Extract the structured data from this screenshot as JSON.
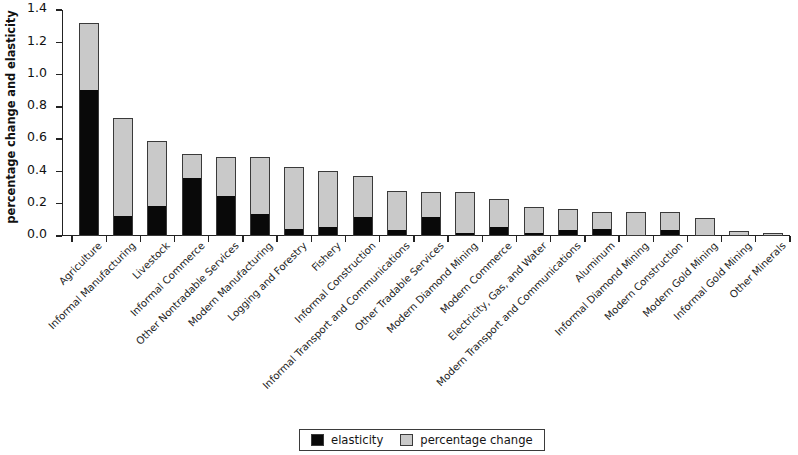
{
  "chart_data": {
    "type": "bar",
    "stacked": true,
    "title": "",
    "subtitle": "",
    "xlabel": "",
    "ylabel": "percentage change and elasticity",
    "ylim": [
      0.0,
      1.4
    ],
    "yticks": [
      "0.0",
      "0.2",
      "0.4",
      "0.6",
      "0.8",
      "1.0",
      "1.2",
      "1.4"
    ],
    "ytick_values": [
      0.0,
      0.2,
      0.4,
      0.6,
      0.8,
      1.0,
      1.2,
      1.4
    ],
    "grid": false,
    "legend_position": "bottom-center",
    "categories": [
      "Agriculture",
      "Informal Manufacturing",
      "Livestock",
      "Informal Commerce",
      "Other Nontradable Services",
      "Modern Manufacturing",
      "Logging and Forestry",
      "Fishery",
      "Informal Construction",
      "Informal Transport and Communications",
      "Other Tradable Services",
      "Modern Diamond Mining",
      "Modern Commerce",
      "Electricity, Gas, and Water",
      "Modern Transport and Communications",
      "Aluminum",
      "Informal Diamond Mining",
      "Modern Construction",
      "Modern Gold Mining",
      "Informal Gold Mining",
      "Other Minerals"
    ],
    "series": [
      {
        "name": "elasticity",
        "color": "#090909",
        "values": [
          0.9,
          0.12,
          0.18,
          0.35,
          0.24,
          0.13,
          0.04,
          0.05,
          0.11,
          0.03,
          0.11,
          0.01,
          0.05,
          0.01,
          0.03,
          0.04,
          0.0,
          0.03,
          0.0,
          0.0,
          0.0
        ]
      },
      {
        "name": "percentage change",
        "color": "#c9c9c9",
        "values": [
          0.42,
          0.61,
          0.41,
          0.16,
          0.25,
          0.36,
          0.39,
          0.35,
          0.26,
          0.25,
          0.16,
          0.26,
          0.18,
          0.17,
          0.14,
          0.11,
          0.15,
          0.12,
          0.11,
          0.03,
          0.02
        ]
      }
    ],
    "totals": [
      1.32,
      0.73,
      0.59,
      0.51,
      0.49,
      0.49,
      0.43,
      0.4,
      0.37,
      0.28,
      0.27,
      0.27,
      0.23,
      0.18,
      0.17,
      0.15,
      0.15,
      0.15,
      0.11,
      0.03,
      0.02
    ]
  },
  "legend": {
    "items": [
      {
        "label": "elasticity",
        "swatch": "black"
      },
      {
        "label": "percentage change",
        "swatch": "grey"
      }
    ]
  },
  "axis": {
    "y_title": "percentage change and elasticity"
  }
}
